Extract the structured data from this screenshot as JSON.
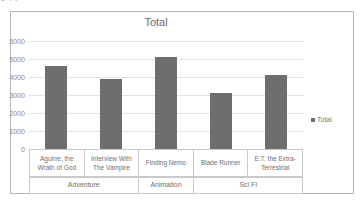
{
  "page": {
    "cut_off_top_text": "o             I                        I"
  },
  "legend": {
    "position": "right",
    "entries": [
      {
        "label": "Total",
        "color": "#6e6e6e",
        "marker": "square-swatch"
      }
    ]
  },
  "axis": {
    "y_ticks": [
      "0",
      "1000",
      "2000",
      "3000",
      "4000",
      "5000",
      "6000"
    ]
  },
  "chart_data": {
    "type": "bar",
    "title": "Total",
    "xlabel": "",
    "ylabel": "",
    "ylim": [
      0,
      6000
    ],
    "ytick_values": [
      0,
      1000,
      2000,
      3000,
      4000,
      5000,
      6000
    ],
    "grid": true,
    "legend_position": "right",
    "bar_color": "#6e6e6e",
    "categories": [
      "Aguirre, the Wrath of God",
      "Interview With The Vampire",
      "Finding Nemo",
      "Blade Runner",
      "E.T. the Extra-Terrestrial"
    ],
    "group_labels": [
      "Adventure",
      "Animation",
      "Sci Fi"
    ],
    "groups": [
      {
        "name": "Adventure",
        "span": 2
      },
      {
        "name": "Animation",
        "span": 1
      },
      {
        "name": "Sci Fi",
        "span": 2
      }
    ],
    "series": [
      {
        "name": "Total",
        "values": [
          4600,
          3900,
          5100,
          3100,
          4100
        ]
      }
    ]
  }
}
